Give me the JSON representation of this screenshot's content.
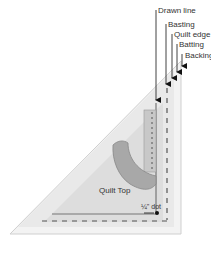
{
  "diagram": {
    "labels": {
      "drawn_line": "Drawn line",
      "basting": "Basting",
      "quilt_edge": "Quilt edge",
      "batting": "Batting",
      "backing": "Backing",
      "quilt_top": "Quilt Top",
      "quarter_inch_dot": "¼\" dot"
    },
    "colors": {
      "backing": "#f2f2f2",
      "batting": "#e6e6e6",
      "quilt_top": "#dcdcdc",
      "applique": "#a6a6a6",
      "lines": "#555555",
      "arrows": "#111111",
      "text": "#333333"
    }
  }
}
